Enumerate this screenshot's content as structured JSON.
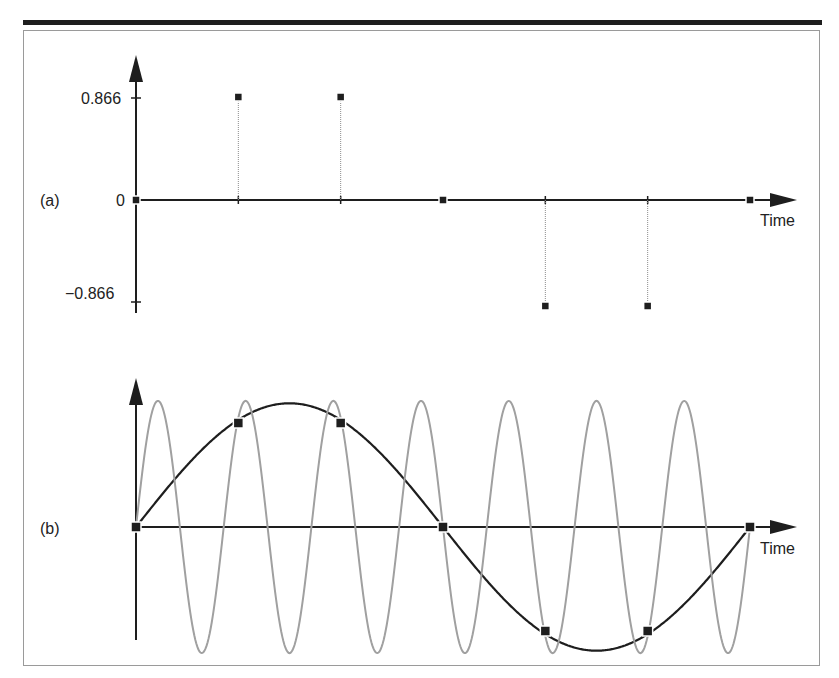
{
  "figure": {
    "panel_a_label": "(a)",
    "panel_b_label": "(b)",
    "y_tick_pos": "0.866",
    "y_tick_zero": "0",
    "y_tick_neg": "−0.866",
    "x_axis_label_a": "Time",
    "x_axis_label_b": "Time"
  },
  "colors": {
    "axis": "#1e1e1e",
    "sample": "#1e1e1e",
    "stem": "#8c8c8c",
    "alias_wave": "#a0a0a0",
    "frame": "#9a9a9a"
  },
  "chart_data": [
    {
      "type": "scatter",
      "title": "(a) Sampled values",
      "xlabel": "Time",
      "ylabel": "",
      "x": [
        0,
        1,
        2,
        3,
        4,
        5,
        6
      ],
      "values": [
        0,
        0.866,
        0.866,
        0,
        -0.866,
        -0.866,
        0
      ],
      "y_ticks": [
        0.866,
        0,
        -0.866
      ],
      "style": "stem",
      "ylim": [
        -1,
        1.2
      ]
    },
    {
      "type": "line",
      "title": "(b) Aliasing: two sinusoids through the same samples",
      "xlabel": "Time",
      "ylabel": "",
      "sample_x": [
        0,
        1,
        2,
        3,
        4,
        5,
        6
      ],
      "sample_values": [
        0,
        0.866,
        0.866,
        0,
        -0.866,
        -0.866,
        0
      ],
      "series": [
        {
          "name": "low-frequency sinusoid (black)",
          "cycles_over_range": 1,
          "amplitude": 1
        },
        {
          "name": "high-frequency sinusoid (gray)",
          "cycles_over_range": 7,
          "amplitude": 1
        }
      ],
      "ylim": [
        -1.2,
        1.2
      ]
    }
  ]
}
